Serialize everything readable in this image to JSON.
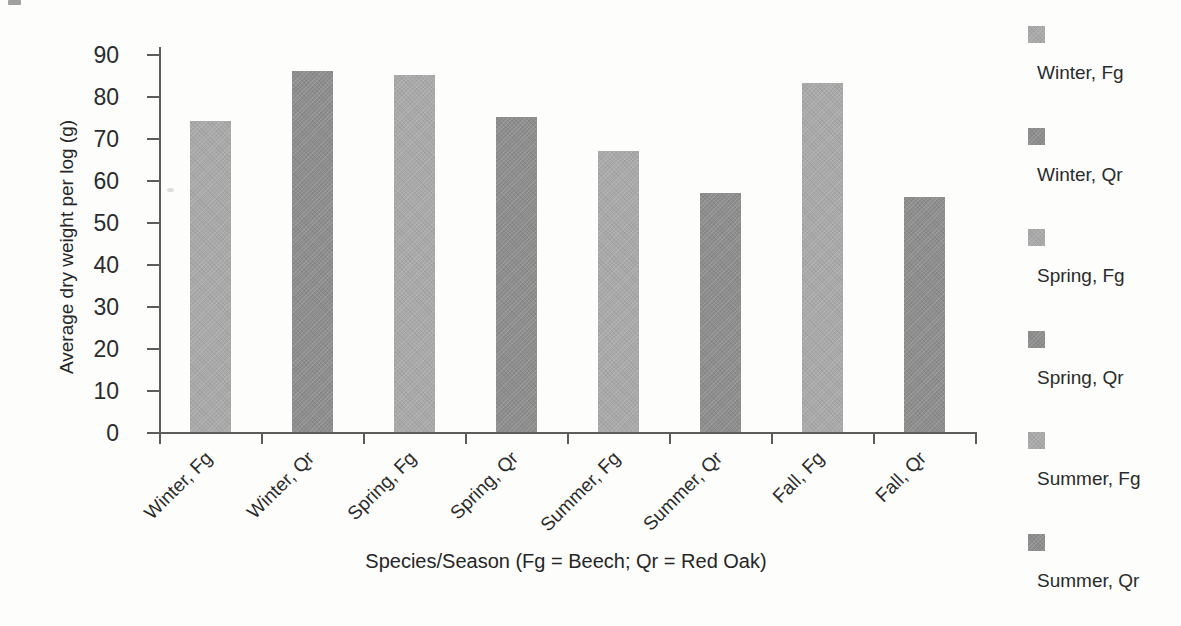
{
  "chart_data": {
    "type": "bar",
    "title": "",
    "xlabel": "Species/Season (Fg = Beech; Qr = Red Oak)",
    "ylabel": "Average dry weight per log (g)",
    "categories": [
      "Winter, Fg",
      "Winter, Qr",
      "Spring, Fg",
      "Spring, Qr",
      "Summer, Fg",
      "Summer, Qr",
      "Fall, Fg",
      "Fall, Qr"
    ],
    "values": [
      74,
      86,
      85,
      75,
      67,
      57,
      83,
      56
    ],
    "bar_shades": [
      "light",
      "dark",
      "light",
      "dark",
      "light",
      "dark",
      "light",
      "dark"
    ],
    "colors": {
      "light": "#a9a9a9",
      "dark": "#8d8d8d"
    },
    "ylim": [
      0,
      90
    ],
    "yticks": [
      0,
      10,
      20,
      30,
      40,
      50,
      60,
      70,
      80,
      90
    ],
    "grid": false,
    "legend_position": "right",
    "legend": {
      "items": [
        {
          "label": "Winter, Fg",
          "shade": "light"
        },
        {
          "label": "Winter, Qr",
          "shade": "dark"
        },
        {
          "label": "Spring, Fg",
          "shade": "light"
        },
        {
          "label": "Spring, Qr",
          "shade": "dark"
        },
        {
          "label": "Summer, Fg",
          "shade": "light"
        },
        {
          "label": "Summer, Qr",
          "shade": "dark"
        }
      ]
    }
  }
}
